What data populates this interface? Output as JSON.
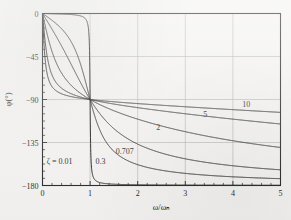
{
  "figure": {
    "kind": "bode-phase-plot",
    "background_color": "#f4f3f1",
    "ink_color": "#151515",
    "grid_color": "#a9a9a9"
  },
  "axes": {
    "x_title": "ω/ωₙ",
    "y_title": "φ(°)",
    "x_tick_labels": [
      "0",
      "1",
      "2",
      "3",
      "4",
      "5"
    ],
    "y_tick_labels": [
      "0",
      "−45",
      "−90",
      "−135",
      "−180"
    ]
  },
  "curve_labels": [
    {
      "text": "ζ = 0.01",
      "name": "curve-label-zeta-0-01"
    },
    {
      "text": "0.3",
      "name": "curve-label-0-3"
    },
    {
      "text": "0.707",
      "name": "curve-label-0-707"
    },
    {
      "text": "2",
      "name": "curve-label-2"
    },
    {
      "text": "5",
      "name": "curve-label-5"
    },
    {
      "text": "10",
      "name": "curve-label-10"
    }
  ],
  "chart_data": {
    "type": "line",
    "title": "",
    "subtitle": "",
    "xlabel": "ω/ωₙ",
    "ylabel": "φ(°)",
    "xlim": [
      0,
      5
    ],
    "ylim": [
      -180,
      0
    ],
    "xticks": [
      0,
      1,
      2,
      3,
      4,
      5
    ],
    "yticks": [
      0,
      -45,
      -90,
      -135,
      -180
    ],
    "x_minor_tick_step": 0.2,
    "grid": true,
    "grid_x_values": [
      1,
      2,
      3,
      4
    ],
    "grid_y_values": [
      -45,
      -90,
      -135
    ],
    "legend": "inline-curve-labels",
    "legend_position": "inside-plot",
    "annotations": [
      {
        "label": "ζ = 0.01",
        "x": 0.36,
        "y": -158
      },
      {
        "label": "0.3",
        "x": 1.22,
        "y": -158
      },
      {
        "label": "0.707",
        "x": 1.73,
        "y": -147
      },
      {
        "label": "2",
        "x": 2.43,
        "y": -122
      },
      {
        "label": "5",
        "x": 3.42,
        "y": -108
      },
      {
        "label": "10",
        "x": 4.28,
        "y": -98
      }
    ],
    "formula": "phi = -atan2(2*zeta*r, 1-r^2), r = omega/omega_n",
    "series": [
      {
        "name": "ζ = 0.01",
        "zeta": 0.01,
        "x": [
          0,
          0.2,
          0.4,
          0.6,
          0.8,
          0.9,
          0.95,
          0.98,
          0.99,
          1.0,
          1.01,
          1.02,
          1.05,
          1.1,
          1.2,
          1.4,
          1.6,
          2.0,
          2.5,
          3.0,
          3.5,
          4.0,
          4.5,
          5.0
        ],
        "y": [
          0,
          -0.24,
          -0.55,
          -1.07,
          -2.55,
          -5.42,
          -11.31,
          -26.57,
          -45.0,
          -90.0,
          -135.0,
          -153.43,
          -168.69,
          -174.58,
          -177.45,
          -178.93,
          -179.39,
          -179.69,
          -179.81,
          -179.86,
          -179.89,
          -179.9,
          -179.92,
          -179.92
        ]
      },
      {
        "name": "0.3",
        "zeta": 0.3,
        "x": [
          0,
          0.2,
          0.4,
          0.6,
          0.8,
          1.0,
          1.2,
          1.4,
          1.6,
          1.8,
          2.0,
          2.5,
          3.0,
          3.5,
          4.0,
          4.5,
          5.0
        ],
        "y": [
          0,
          -7.13,
          -16.26,
          -29.36,
          -53.13,
          -90.0,
          -123.56,
          -142.43,
          -153.04,
          -159.25,
          -163.15,
          -168.79,
          -171.64,
          -173.32,
          -174.42,
          -175.2,
          -175.77
        ]
      },
      {
        "name": "0.707",
        "zeta": 0.707,
        "x": [
          0,
          0.2,
          0.4,
          0.6,
          0.8,
          1.0,
          1.2,
          1.4,
          1.6,
          1.8,
          2.0,
          2.5,
          3.0,
          3.5,
          4.0,
          4.5,
          5.0
        ],
        "y": [
          0,
          -16.5,
          -35.3,
          -56.6,
          -77.7,
          -90.0,
          -115.5,
          -133.4,
          -145.0,
          -152.5,
          -157.4,
          -164.7,
          -168.3,
          -170.5,
          -171.9,
          -172.9,
          -173.6
        ]
      },
      {
        "name": "2",
        "zeta": 2,
        "x": [
          0,
          0.2,
          0.4,
          0.6,
          0.8,
          1.0,
          1.2,
          1.4,
          1.6,
          1.8,
          2.0,
          2.5,
          3.0,
          3.5,
          4.0,
          4.5,
          5.0
        ],
        "y": [
          0,
          -39.8,
          -59.5,
          -70.3,
          -77.3,
          -90.0,
          -109.6,
          -121.8,
          -130.4,
          -136.7,
          -141.3,
          -149.5,
          -154.5,
          -157.9,
          -160.3,
          -162.1,
          -163.5
        ]
      },
      {
        "name": "5",
        "zeta": 5,
        "x": [
          0,
          0.2,
          0.4,
          0.6,
          0.8,
          1.0,
          1.2,
          1.4,
          1.6,
          1.8,
          2.0,
          2.5,
          3.0,
          3.5,
          4.0,
          4.5,
          5.0
        ],
        "y": [
          0,
          -64.5,
          -76.8,
          -82.0,
          -85.0,
          -90.0,
          -99.9,
          -106.9,
          -112.3,
          -116.6,
          -120.1,
          -126.8,
          -131.5,
          -135.0,
          -137.6,
          -139.7,
          -141.4
        ]
      },
      {
        "name": "10",
        "zeta": 10,
        "x": [
          0,
          0.2,
          0.4,
          0.6,
          0.8,
          1.0,
          1.2,
          1.4,
          1.6,
          1.8,
          2.0,
          2.5,
          3.0,
          3.5,
          4.0,
          4.5,
          5.0
        ],
        "y": [
          0,
          -76.5,
          -83.3,
          -86.0,
          -87.5,
          -90.0,
          -95.1,
          -98.9,
          -102.0,
          -104.6,
          -106.8,
          -111.3,
          -114.7,
          -117.4,
          -119.6,
          -121.4,
          -122.9
        ]
      }
    ]
  }
}
